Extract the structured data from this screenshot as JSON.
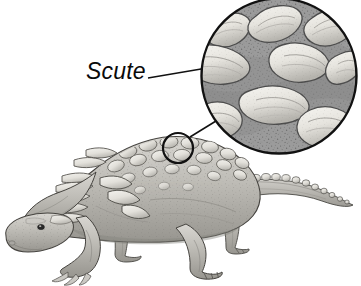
{
  "figure": {
    "background_color": "#ffffff",
    "width": 361,
    "height": 286,
    "style": "grayscale pen-and-ink scientific illustration"
  },
  "labels": [
    {
      "id": "scute",
      "text": "Scute",
      "style": "italic",
      "color": "#0a0a0a",
      "x": 86,
      "y": 58
    }
  ],
  "leader_lines": [
    {
      "id": "label-to-magnifier",
      "from_x": 148,
      "from_y": 78,
      "to_x": 207,
      "to_y": 68,
      "color": "#111111"
    },
    {
      "id": "detail-circle-to-magnifier",
      "from_x": 190,
      "from_y": 137,
      "to_x": 215,
      "to_y": 122,
      "color": "#111111"
    }
  ],
  "magnifier": {
    "id": "magnified-scute-inset",
    "center_x": 279,
    "center_y": 76,
    "radius": 79,
    "stroke_color": "#111111",
    "stroke_width": 2.4,
    "skin_color": "#9b9b9b",
    "scute_color": "#e8e6e0",
    "scute_shadow_color": "#8b8b8b",
    "stipple_color": "#5f5f5f",
    "scute_count": 9
  },
  "detail_circle": {
    "id": "body-detail-circle",
    "center_x": 178,
    "center_y": 148,
    "radius": 15,
    "stroke_color": "#111111",
    "stroke_width": 2.2
  },
  "colors": {
    "ink": "#2b2b2b",
    "outline": "#3a3a3a",
    "body_light": "#d9d7d2",
    "body_mid": "#b3b1ab",
    "body_dark": "#8e8c87",
    "shadow": "#6d6b67",
    "highlight": "#f2f1ed",
    "eye": "#2a2a2a"
  },
  "anatomy": {
    "parts": [
      {
        "name": "head",
        "label": "Head"
      },
      {
        "name": "neck",
        "label": "Neck"
      },
      {
        "name": "torso",
        "label": "Torso"
      },
      {
        "name": "shoulder-spikes",
        "label": "Shoulder spikes"
      },
      {
        "name": "back-scutes",
        "label": "Back scutes"
      },
      {
        "name": "foreleg-left",
        "label": "Left foreleg"
      },
      {
        "name": "foreleg-right",
        "label": "Right foreleg"
      },
      {
        "name": "hindleg-left",
        "label": "Left hindleg"
      },
      {
        "name": "hindleg-right",
        "label": "Right hindleg"
      },
      {
        "name": "tail",
        "label": "Tail"
      },
      {
        "name": "tail-spikes",
        "label": "Tail spikes"
      },
      {
        "name": "eye",
        "label": "Eye"
      }
    ]
  }
}
